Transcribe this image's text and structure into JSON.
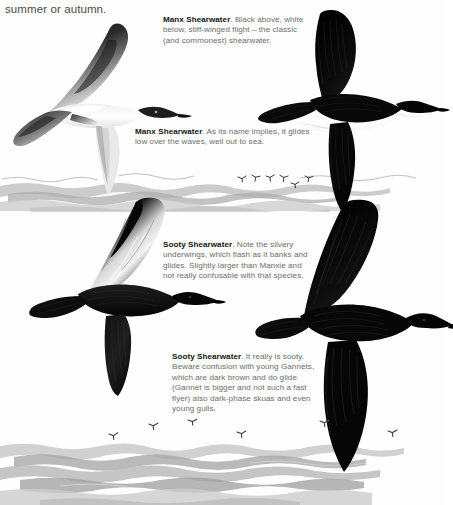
{
  "page": {
    "running_text": "summer or autumn.",
    "background_color": "#fefefe",
    "body_text_color": "#6d6d6d",
    "heading_text_color": "#141414"
  },
  "captions": [
    {
      "id": "manx-upper",
      "species": "Manx Shearwater",
      "text": ". Black above, white below, stiff-winged flight – the classic (and commonest) shearwater."
    },
    {
      "id": "manx-lower",
      "species": "Manx Shearwater",
      "text": ". As its name implies, it glides low over the waves, well out to sea."
    },
    {
      "id": "sooty-upper",
      "species": "Sooty Shearwater",
      "text": ". Note the silvery underwings, which flash as it banks and glides. Slightly larger than Manxie and not really confusable with that species."
    },
    {
      "id": "sooty-lower",
      "species": "Sooty Shearwater",
      "text": ". It really is sooty. Beware confusion with young Gannets, which are dark brown and do glide (Gannet is bigger and not such a fast flyer) also dark-phase skuas and even young gulls."
    }
  ],
  "illustrations": [
    {
      "id": "manx-light",
      "name": "manx-shearwater-underside-illustration",
      "description": "Manx Shearwater banking, showing white underparts and dark upperwing"
    },
    {
      "id": "manx-dark",
      "name": "manx-shearwater-upperside-illustration",
      "description": "Manx Shearwater from above, black upperparts, wings raised"
    },
    {
      "id": "sooty-left",
      "name": "sooty-shearwater-silvery-underwing-illustration",
      "description": "Sooty Shearwater banking, silvery flash on underwing"
    },
    {
      "id": "sooty-right",
      "name": "sooty-shearwater-dark-illustration",
      "description": "Sooty Shearwater gliding, uniformly sooty-brown plumage"
    }
  ],
  "scenery": [
    {
      "id": "sea-mid",
      "name": "sea-horizon-band-upper"
    },
    {
      "id": "sea-bottom",
      "name": "sea-horizon-band-lower"
    }
  ],
  "distant_birds": {
    "upper_flock_count": 6,
    "lower_flock_count": 6
  }
}
